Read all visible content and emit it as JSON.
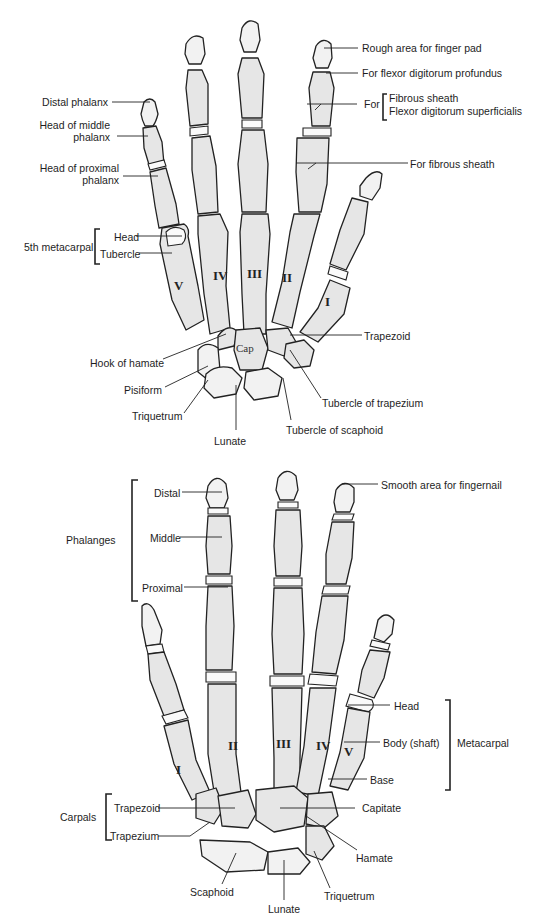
{
  "figure": {
    "palmar_view": {
      "labels": {
        "distal_phalanx": "Distal phalanx",
        "head_middle_phalanx_1": "Head of middle",
        "head_middle_phalanx_2": "phalanx",
        "head_proximal_phalanx_1": "Head of proximal",
        "head_proximal_phalanx_2": "phalanx",
        "fifth_metacarpal": "5th metacarpal",
        "head": "Head",
        "tubercle": "Tubercle",
        "hook_of_hamate": "Hook of hamate",
        "pisiform": "Pisiform",
        "triquetrum": "Triquetrum",
        "lunate": "Lunate",
        "rough_area": "Rough area for finger pad",
        "flexor_profundus": "For flexor digitorum profundus",
        "for_prefix": "For",
        "fibrous_sheath": "Fibrous sheath",
        "flexor_superficialis": "Flexor digitorum superficialis",
        "for_fibrous_sheath": "For fibrous sheath",
        "trapezoid": "Trapezoid",
        "tubercle_trapezium": "Tubercle of trapezium",
        "tubercle_scaphoid": "Tubercle of scaphoid",
        "capitate_abbrev": "Cap"
      },
      "metacarpal_numerals": [
        "I",
        "II",
        "III",
        "IV",
        "V"
      ]
    },
    "dorsal_view": {
      "labels": {
        "phalanges": "Phalanges",
        "distal": "Distal",
        "middle": "Middle",
        "proximal": "Proximal",
        "smooth_area": "Smooth area for fingernail",
        "head": "Head",
        "body_shaft": "Body (shaft)",
        "base": "Base",
        "metacarpal": "Metacarpal",
        "carpals": "Carpals",
        "trapezoid": "Trapezoid",
        "trapezium": "Trapezium",
        "capitate": "Capitate",
        "hamate": "Hamate",
        "scaphoid": "Scaphoid",
        "triquetrum": "Triquetrum",
        "lunate": "Lunate"
      },
      "metacarpal_numerals": [
        "I",
        "II",
        "III",
        "IV",
        "V"
      ]
    }
  }
}
